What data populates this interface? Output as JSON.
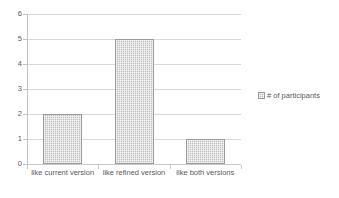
{
  "chart_data": {
    "type": "bar",
    "title": "",
    "subtitle": "",
    "xlabel": "",
    "ylabel": "",
    "categories": [
      "like current version",
      "like refined version",
      "like both versions"
    ],
    "series": [
      {
        "name": "# of participants",
        "values": [
          2,
          5,
          1
        ]
      }
    ],
    "values": [
      2,
      5,
      1
    ],
    "ylim": [
      0,
      6
    ],
    "ytick_labels": [
      "0",
      "1",
      "2",
      "3",
      "4",
      "5",
      "6"
    ],
    "ytick_values": [
      0,
      1,
      2,
      3,
      4,
      5,
      6
    ],
    "grid": true,
    "grid_axis": "y",
    "legend": {
      "position": "right",
      "entries": [
        {
          "label": "# of participants",
          "swatch_color": "#cfcfcf",
          "swatch_border": "#9a9a9a"
        }
      ]
    },
    "colors": {
      "bar_fill": "#cfcfcf",
      "bar_border": "#9a9a9a",
      "gridline": "#d9d9d9",
      "axis_line": "#c3c3c3",
      "text": "#595959",
      "background": "#ffffff"
    }
  }
}
